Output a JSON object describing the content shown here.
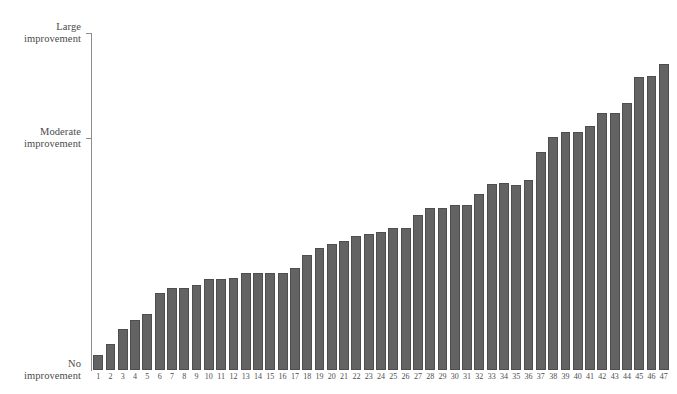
{
  "chart_data": {
    "type": "bar",
    "title": "",
    "subtitle": "",
    "xlabel": "",
    "ylabel": "",
    "grid": false,
    "legend": null,
    "orientation": "vertical",
    "sorted": "ascending",
    "bar_color": "#636363",
    "bar_edge_color": "#4e4e4e",
    "axis_color": "#8d8d8d",
    "background_color": "#ffffff",
    "ylim": [
      0,
      100
    ],
    "y_axis_type": "categorical-scale",
    "y_tick_values": [
      0,
      68.8,
      100
    ],
    "y_tick_labels": [
      [
        "No",
        "improvement"
      ],
      [
        "Moderate",
        "improvement"
      ],
      [
        "Large",
        "improvement"
      ]
    ],
    "categories": [
      "1",
      "2",
      "3",
      "4",
      "5",
      "6",
      "7",
      "8",
      "9",
      "10",
      "11",
      "12",
      "13",
      "14",
      "15",
      "16",
      "17",
      "18",
      "19",
      "20",
      "21",
      "22",
      "23",
      "24",
      "25",
      "26",
      "27",
      "28",
      "29",
      "30",
      "31",
      "32",
      "33",
      "34",
      "35",
      "36",
      "37",
      "38",
      "39",
      "40",
      "41",
      "42",
      "43",
      "44",
      "45",
      "46",
      "47"
    ],
    "values": [
      4.5,
      7.7,
      12.2,
      14.8,
      16.6,
      22.8,
      24.3,
      24.3,
      25.2,
      27.0,
      27.0,
      27.3,
      28.8,
      28.8,
      28.8,
      28.8,
      30.3,
      34.1,
      36.2,
      37.4,
      38.3,
      39.8,
      40.4,
      41.0,
      42.1,
      42.1,
      46.0,
      48.1,
      48.1,
      49.0,
      49.0,
      52.2,
      55.2,
      55.5,
      54.9,
      56.4,
      64.7,
      69.1,
      70.6,
      70.6,
      72.4,
      76.3,
      76.3,
      79.2,
      86.9,
      87.2,
      90.8
    ]
  }
}
